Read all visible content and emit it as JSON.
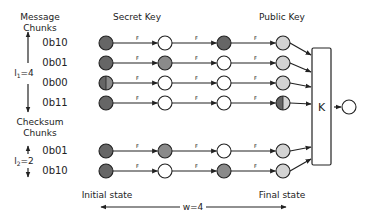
{
  "headers": {
    "message_chunks": [
      "Message",
      "Chunks"
    ],
    "secret_key": "Secret Key",
    "public_key": "Public Key",
    "checksum_chunks": [
      "Checksum",
      "Chunks"
    ]
  },
  "params": {
    "l1_prefix": "l",
    "l1_sub": "1",
    "l1_value": "=4",
    "l2_prefix": "l",
    "l2_sub": "2",
    "l2_value": "=2",
    "w_label": "w=4"
  },
  "footer": {
    "initial_state": "Initial state",
    "final_state": "Final state"
  },
  "function_label": "F",
  "combiner_label": "K",
  "colors": {
    "dark": "#666666",
    "mid": "#8a8a8a",
    "light": "#d3d3d3",
    "white": "#ffffff",
    "stroke": "#222222"
  },
  "rows": [
    {
      "group": "message",
      "chunk": "0b10",
      "states": [
        "dark",
        "white",
        "dark",
        "light"
      ]
    },
    {
      "group": "message",
      "chunk": "0b01",
      "states": [
        "dark",
        "mid",
        "white",
        "light"
      ]
    },
    {
      "group": "message",
      "chunk": "0b00",
      "states": [
        "half",
        "white",
        "white",
        "light"
      ]
    },
    {
      "group": "message",
      "chunk": "0b11",
      "states": [
        "dark",
        "white",
        "white",
        "half"
      ]
    },
    {
      "group": "checksum",
      "chunk": "0b01",
      "states": [
        "dark",
        "mid",
        "white",
        "light"
      ]
    },
    {
      "group": "checksum",
      "chunk": "0b10",
      "states": [
        "dark",
        "white",
        "mid",
        "light"
      ]
    }
  ]
}
